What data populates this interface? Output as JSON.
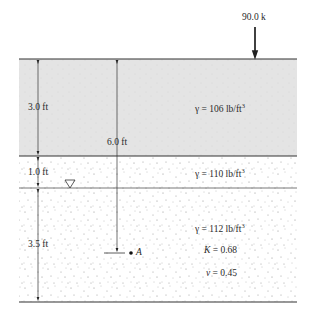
{
  "diagram": {
    "type": "soil-profile",
    "load": {
      "label": "90.0 k",
      "x": 255
    },
    "surface_y": 59,
    "layers": [
      {
        "name": "layer-1",
        "top_y": 59,
        "bottom_y": 156,
        "fill": "#e4e4e4",
        "thickness_label": "3.0 ft",
        "unit_weight_label": "γ = 106 lb/ft",
        "unit_weight_sup": "3"
      },
      {
        "name": "layer-2",
        "top_y": 156,
        "bottom_y": 188,
        "fill": "#ffffff",
        "thickness_label": "1.0 ft",
        "unit_weight_label": "γ = 110 lb/ft",
        "unit_weight_sup": "3"
      },
      {
        "name": "layer-3",
        "top_y": 188,
        "bottom_y": 302,
        "fill": "#ffffff",
        "thickness_label": "3.5 ft",
        "unit_weight_label": "γ = 112 lb/ft",
        "unit_weight_sup": "3",
        "k_label": "K",
        "k_value": " = 0.68",
        "nu_label": "ν",
        "nu_value": " = 0.45"
      }
    ],
    "water_table": {
      "symbol": "▽",
      "y": 188
    },
    "depth_to_A": {
      "label": "6.0 ft"
    },
    "point": {
      "label": "A"
    },
    "colors": {
      "line": "#333333",
      "speckle": "#8a8a8a",
      "layer1_fill": "#e4e4e4"
    }
  }
}
